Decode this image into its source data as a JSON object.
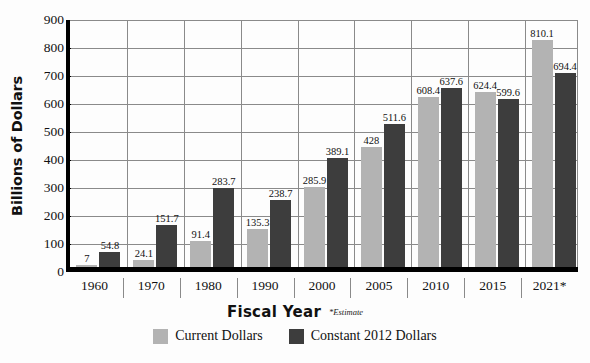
{
  "chart_data": {
    "type": "bar",
    "title": "",
    "xlabel": "Fiscal Year",
    "ylabel": "Billions of Dollars",
    "ylim": [
      0,
      900
    ],
    "ytick_step": 100,
    "yticks": [
      "900",
      "800",
      "700",
      "600",
      "500",
      "400",
      "300",
      "200",
      "100",
      "0"
    ],
    "grid": "horizontal-and-category-separators",
    "legend_position": "bottom-center",
    "categories": [
      "1960",
      "1970",
      "1980",
      "1990",
      "2000",
      "2005",
      "2010",
      "2015",
      "2021*"
    ],
    "series": [
      {
        "name": "Current Dollars",
        "color": "#b3b3b3",
        "values": [
          7,
          24.1,
          91.4,
          135.3,
          285.9,
          428,
          608.4,
          624.4,
          810.1
        ],
        "labels": [
          "7",
          "24.1",
          "91.4",
          "135.3",
          "285.9",
          "428",
          "608.4",
          "624.4",
          "810.1"
        ]
      },
      {
        "name": "Constant 2012 Dollars",
        "color": "#3d3d3d",
        "values": [
          54.8,
          151.7,
          283.7,
          238.7,
          389.1,
          511.6,
          637.6,
          599.6,
          694.4
        ],
        "labels": [
          "54.8",
          "151.7",
          "283.7",
          "238.7",
          "389.1",
          "511.6",
          "637.6",
          "599.6",
          "694.4"
        ]
      }
    ],
    "annotations": [
      {
        "name": "estimate-note",
        "text": "*Estimate"
      }
    ]
  },
  "axes": {
    "y_title": "Billions of Dollars",
    "x_title": "Fiscal Year",
    "estimate_note": "*Estimate"
  },
  "legend": {
    "items": [
      {
        "label": "Current Dollars",
        "color": "#b3b3b3"
      },
      {
        "label": "Constant 2012 Dollars",
        "color": "#3d3d3d"
      }
    ]
  },
  "colors": {
    "current_dollars": "#b3b3b3",
    "constant_dollars": "#3d3d3d",
    "gridline": "#8a8a8a",
    "axis": "#000000",
    "background": "#fdfdfd"
  }
}
